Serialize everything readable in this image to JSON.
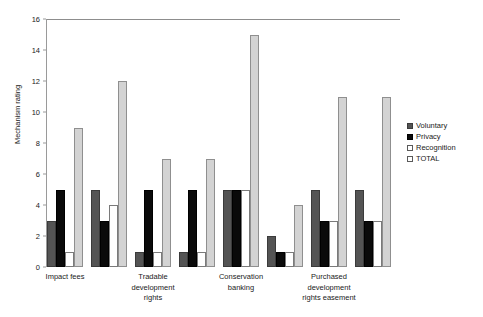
{
  "chart_data": {
    "type": "bar",
    "title": "",
    "xlabel": "",
    "ylabel": "Mechanism rating",
    "ylim": [
      0,
      16
    ],
    "yticks": [
      0,
      2,
      4,
      6,
      8,
      10,
      12,
      14,
      16
    ],
    "grid": false,
    "legend_position": "right",
    "categories": [
      "Impact fees",
      "",
      "Tradable\ndevelopment\nrights",
      "",
      "Conservation\nbanking",
      "",
      "Purchased\ndevelopment\nrights easement",
      ""
    ],
    "series": [
      {
        "name": "Voluntary",
        "color": "#545454",
        "values": [
          3,
          5,
          1,
          1,
          5,
          2,
          5,
          5
        ]
      },
      {
        "name": "Privacy",
        "color": "#0a0a0a",
        "values": [
          5,
          3,
          5,
          5,
          5,
          1,
          3,
          3
        ]
      },
      {
        "name": "Recognition",
        "color": "#ffffff",
        "values": [
          1,
          4,
          1,
          1,
          5,
          1,
          3,
          3
        ]
      },
      {
        "name": "TOTAL",
        "color": "#d3d3d3",
        "values": [
          9,
          12,
          7,
          7,
          15,
          4,
          11,
          11
        ]
      }
    ],
    "axis_color": "#9a9a9a"
  }
}
